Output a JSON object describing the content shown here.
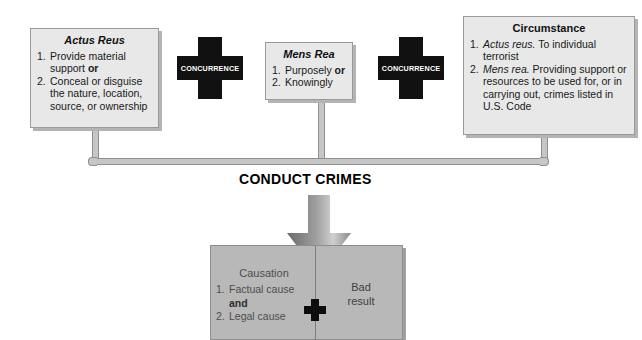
{
  "diagram": {
    "title_center": "CONDUCT CRIMES",
    "boxes": [
      {
        "id": "actus-reus",
        "title": "Actus Reus",
        "title_style": "italic",
        "items": [
          {
            "num": "1.",
            "parts": [
              {
                "t": "Provide material support ",
                "s": "normal"
              },
              {
                "t": "or",
                "s": "bold"
              }
            ]
          },
          {
            "num": "2.",
            "parts": [
              {
                "t": "Conceal or disguise the nature, location, source, or ownership",
                "s": "normal"
              }
            ]
          }
        ]
      },
      {
        "id": "mens-rea",
        "title": "Mens Rea",
        "title_style": "italic",
        "items": [
          {
            "num": "1.",
            "parts": [
              {
                "t": "Purposely ",
                "s": "normal"
              },
              {
                "t": "or",
                "s": "bold"
              }
            ]
          },
          {
            "num": "2.",
            "parts": [
              {
                "t": "Knowingly",
                "s": "normal"
              }
            ]
          }
        ]
      },
      {
        "id": "circumstance",
        "title": "Circumstance",
        "title_style": "upright",
        "items": [
          {
            "num": "1.",
            "parts": [
              {
                "t": "Actus reus.",
                "s": "italic"
              },
              {
                "t": " To individual terrorist",
                "s": "normal"
              }
            ]
          },
          {
            "num": "2.",
            "parts": [
              {
                "t": "Mens rea.",
                "s": "italic"
              },
              {
                "t": " Providing support or resources to be used for, or in carrying out, crimes listed in U.S. Code",
                "s": "normal"
              }
            ]
          }
        ]
      }
    ],
    "connectors": [
      {
        "id": "concurrence-1",
        "label": "CONCURRENCE"
      },
      {
        "id": "concurrence-2",
        "label": "CONCURRENCE"
      }
    ],
    "result": {
      "left_title": "Causation",
      "left_items": [
        {
          "num": "1.",
          "text": "Factual cause"
        },
        {
          "num": "2.",
          "text": "Legal cause"
        }
      ],
      "conjunction": "and",
      "right_line1": "Bad",
      "right_line2": "result",
      "plus_sign": "plus-sign"
    },
    "colors": {
      "box_fill": "#e8e8e8",
      "box_border": "#9a9a9a",
      "cross_fill": "#111111",
      "cross_text": "#ffffff",
      "result_fill": "#b8b8b8",
      "connector_fill": "#c6c6c6",
      "arrow_dark": "#6e6e6e",
      "arrow_light": "#c9c9c9"
    }
  }
}
